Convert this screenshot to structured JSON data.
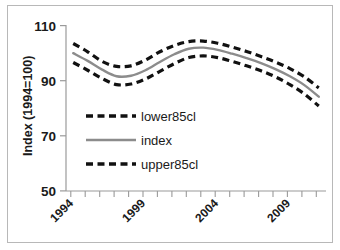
{
  "chart_data": {
    "type": "line",
    "title": "",
    "xlabel": "",
    "ylabel": "Index (1994=100)",
    "xlim": [
      1993.5,
      2011.5
    ],
    "ylim": [
      50,
      110
    ],
    "yticks": [
      50,
      70,
      90,
      110
    ],
    "xticks": [
      1994,
      1999,
      2004,
      2009
    ],
    "xtick_labels": [
      "1994",
      "1999",
      "2004",
      "2009"
    ],
    "xtick_rotation": -45,
    "grid": false,
    "legend_position": "center-left-inside",
    "x": [
      1994,
      1995,
      1996,
      1997,
      1998,
      1999,
      2000,
      2001,
      2002,
      2003,
      2004,
      2005,
      2006,
      2007,
      2008,
      2009,
      2010,
      2011
    ],
    "series": [
      {
        "name": "lower85cl",
        "style": "dashed",
        "color": "#111111",
        "values": [
          103.5,
          100.5,
          97.0,
          95.2,
          95.4,
          97.5,
          100.5,
          102.8,
          104.2,
          104.4,
          103.6,
          102.2,
          100.6,
          98.8,
          96.8,
          94.4,
          91.4,
          87.4
        ]
      },
      {
        "name": "index",
        "style": "solid",
        "color": "#8c8c8c",
        "values": [
          100.0,
          97.2,
          94.0,
          91.6,
          91.8,
          93.8,
          96.8,
          99.6,
          101.6,
          102.0,
          101.2,
          99.8,
          98.2,
          96.4,
          94.2,
          91.6,
          88.4,
          84.2
        ]
      },
      {
        "name": "upper85cl",
        "style": "dashed",
        "color": "#111111",
        "values": [
          96.6,
          93.8,
          90.8,
          88.6,
          88.8,
          90.6,
          93.4,
          96.2,
          98.4,
          99.0,
          98.4,
          97.0,
          95.4,
          93.6,
          91.4,
          88.6,
          85.2,
          80.8
        ]
      }
    ],
    "legend": [
      {
        "label": "lower85cl",
        "style": "dashed",
        "color": "#111111"
      },
      {
        "label": "index",
        "style": "solid",
        "color": "#8c8c8c"
      },
      {
        "label": "upper85cl",
        "style": "dashed",
        "color": "#111111"
      }
    ]
  },
  "axis": {
    "y_title": "Index (1994=100)",
    "y_labels": [
      "110",
      "90",
      "70",
      "50"
    ],
    "x_labels": [
      "1994",
      "1999",
      "2004",
      "2009"
    ]
  },
  "legend": {
    "items": [
      "lower85cl",
      "index",
      "upper85cl"
    ]
  }
}
